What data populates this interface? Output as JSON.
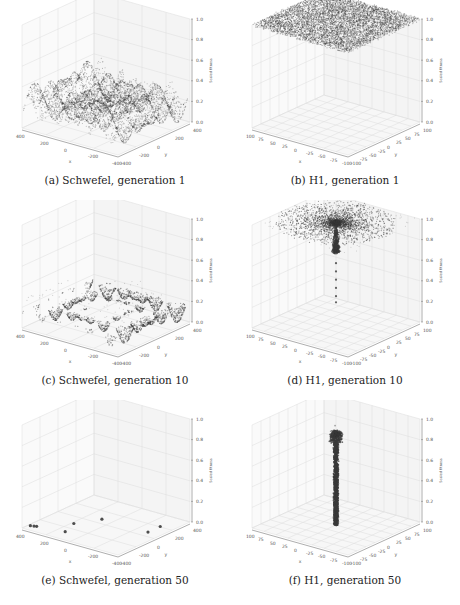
{
  "figure": {
    "panels": [
      {
        "id": "a",
        "caption": "(a) Schwefel, generation 1",
        "function": "Schwefel",
        "generation": 1,
        "x_ticks": [
          "400",
          "200",
          "0",
          "-200",
          "-400"
        ],
        "y_ticks": [
          "400",
          "200",
          "0",
          "-200",
          "-400"
        ],
        "z_ticks": [
          "0.0",
          "0.2",
          "0.4",
          "0.6",
          "0.8",
          "1.0"
        ],
        "xlabel": "x",
        "ylabel": "y",
        "zlabel": "Scaled fitness",
        "pattern": "schwefel_dense"
      },
      {
        "id": "b",
        "caption": "(b) H1, generation 1",
        "function": "H1",
        "generation": 1,
        "x_ticks": [
          "100",
          "75",
          "50",
          "25",
          "0",
          "-25",
          "-50",
          "-75",
          "-100"
        ],
        "y_ticks": [
          "100",
          "75",
          "50",
          "25",
          "0",
          "-25",
          "-50",
          "-75",
          "-100"
        ],
        "z_ticks": [
          "0.0",
          "0.2",
          "0.4",
          "0.6",
          "0.8",
          "1.0"
        ],
        "xlabel": "x",
        "ylabel": "y",
        "zlabel": "Scaled fitness",
        "pattern": "h1_flat"
      },
      {
        "id": "c",
        "caption": "(c) Schwefel, generation 10",
        "function": "Schwefel",
        "generation": 10,
        "x_ticks": [
          "400",
          "200",
          "0",
          "-200",
          "-400"
        ],
        "y_ticks": [
          "400",
          "200",
          "0",
          "-200",
          "-400"
        ],
        "z_ticks": [
          "0.0",
          "0.2",
          "0.4",
          "0.6",
          "0.8",
          "1.0"
        ],
        "xlabel": "x",
        "ylabel": "y",
        "zlabel": "Scaled fitness",
        "pattern": "schwefel_sparse"
      },
      {
        "id": "d",
        "caption": "(d) H1, generation 10",
        "function": "H1",
        "generation": 10,
        "x_ticks": [
          "100",
          "75",
          "50",
          "25",
          "0",
          "-25",
          "-50",
          "-75",
          "-100"
        ],
        "y_ticks": [
          "100",
          "75",
          "50",
          "25",
          "0",
          "-25",
          "-50",
          "-75",
          "-100"
        ],
        "z_ticks": [
          "0.0",
          "0.2",
          "0.4",
          "0.6",
          "0.8",
          "1.0"
        ],
        "xlabel": "x",
        "ylabel": "y",
        "zlabel": "Scaled fitness",
        "pattern": "h1_funnel"
      },
      {
        "id": "e",
        "caption": "(e) Schwefel, generation 50",
        "function": "Schwefel",
        "generation": 50,
        "x_ticks": [
          "400",
          "200",
          "0",
          "-200",
          "-400"
        ],
        "y_ticks": [
          "400",
          "200",
          "0",
          "-200",
          "-400"
        ],
        "z_ticks": [
          "0.0",
          "0.2",
          "0.4",
          "0.6",
          "0.8",
          "1.0"
        ],
        "xlabel": "x",
        "ylabel": "y",
        "zlabel": "Scaled fitness",
        "pattern": "schwefel_points"
      },
      {
        "id": "f",
        "caption": "(f) H1, generation 50",
        "function": "H1",
        "generation": 50,
        "x_ticks": [
          "100",
          "75",
          "50",
          "25",
          "0",
          "-25",
          "-50",
          "-75",
          "-100"
        ],
        "y_ticks": [
          "100",
          "75",
          "50",
          "25",
          "0",
          "-25",
          "-50",
          "-75",
          "-100"
        ],
        "z_ticks": [
          "0.0",
          "0.2",
          "0.4",
          "0.6",
          "0.8",
          "1.0"
        ],
        "xlabel": "x",
        "ylabel": "y",
        "zlabel": "Scaled fitness",
        "pattern": "h1_spike"
      }
    ]
  },
  "chart_data": [
    {
      "type": "scatter",
      "title": "(a) Schwefel, generation 1",
      "xlabel": "x",
      "ylabel": "y",
      "zlabel": "Scaled fitness",
      "xlim": [
        -500,
        500
      ],
      "ylim": [
        -500,
        500
      ],
      "zlim": [
        0,
        1
      ],
      "description": "Dense population covering the whole domain; fitness values 0.0-0.4 forming a rippled multimodal surface"
    },
    {
      "type": "scatter",
      "title": "(b) H1, generation 1",
      "xlabel": "x",
      "ylabel": "y",
      "zlabel": "Scaled fitness",
      "xlim": [
        -100,
        100
      ],
      "ylim": [
        -100,
        100
      ],
      "zlim": [
        0,
        1
      ],
      "description": "Dense population uniformly across domain with fitness near 1.0 (flat plane)"
    },
    {
      "type": "scatter",
      "title": "(c) Schwefel, generation 10",
      "xlabel": "x",
      "ylabel": "y",
      "zlabel": "Scaled fitness",
      "xlim": [
        -500,
        500
      ],
      "ylim": [
        -500,
        500
      ],
      "zlim": [
        0,
        1
      ],
      "description": "Population concentrated in several basins (local minima) with fitness 0.0-0.2"
    },
    {
      "type": "scatter",
      "title": "(d) H1, generation 10",
      "xlabel": "x",
      "ylabel": "y",
      "zlabel": "Scaled fitness",
      "xlim": [
        -100,
        100
      ],
      "ylim": [
        -100,
        100
      ],
      "zlim": [
        0,
        1
      ],
      "description": "Population funnels toward center; cluster at z≈1.0 with a narrow spike descending to z≈0.2"
    },
    {
      "type": "scatter",
      "title": "(e) Schwefel, generation 50",
      "xlabel": "x",
      "ylabel": "y",
      "zlabel": "Scaled fitness",
      "xlim": [
        -500,
        500
      ],
      "ylim": [
        -500,
        500
      ],
      "zlim": [
        0,
        1
      ],
      "description": "Population converged to ~7 isolated points near z≈0"
    },
    {
      "type": "scatter",
      "title": "(f) H1, generation 50",
      "xlabel": "x",
      "ylabel": "y",
      "zlabel": "Scaled fitness",
      "xlim": [
        -100,
        100
      ],
      "ylim": [
        -100,
        100
      ],
      "zlim": [
        0,
        1
      ],
      "description": "Population converged to a narrow vertical spike at center from z≈0 to z≈0.9"
    }
  ]
}
